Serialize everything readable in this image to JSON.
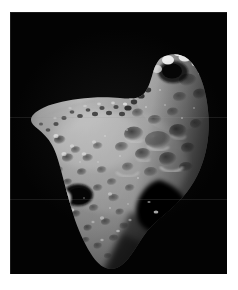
{
  "page": {
    "background_color": "#ffffff",
    "width": 238,
    "height": 290
  },
  "photo": {
    "kind": "astronomical-photograph",
    "subject": "asteroid",
    "caption": "",
    "space_background_color": "#030303",
    "plate": {
      "x": 10,
      "y": 12,
      "width": 217,
      "height": 262
    },
    "palette": {
      "space_black": "#030303",
      "terminator_shadow": "#151515",
      "regolith_dark": "#4a4a4a",
      "regolith_mid": "#8e8e8e",
      "regolith_light": "#b9b9b9",
      "highlight": "#e6e6e6",
      "specular": "#f4f4f4"
    },
    "lighting": {
      "description": "illumination from upper-left, deep shadow at lower-right saddle",
      "sun_direction": "upper-left"
    }
  },
  "chart_data": {
    "type": "image",
    "title": "",
    "features": [
      {
        "name": "upper-lobe",
        "label": "northern lobe with bright crater rims"
      },
      {
        "name": "saddle-notch",
        "label": "concave notch on the upper-left limb"
      },
      {
        "name": "dark-crater",
        "label": "large shadowed crater, lower-left"
      },
      {
        "name": "shadow-saddle",
        "label": "deep shadowed indentation, right side"
      },
      {
        "name": "southern-lobe",
        "label": "broad southern lobe tapering to a point"
      }
    ]
  }
}
